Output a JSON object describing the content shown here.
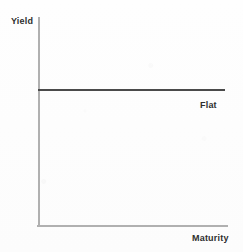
{
  "chart_data": {
    "type": "line",
    "title": "",
    "subtitle": "",
    "xlabel": "Maturity",
    "ylabel": "Yield",
    "grid": false,
    "legend": "none",
    "xlim": [
      0,
      100
    ],
    "ylim": [
      0,
      100
    ],
    "xticks": [],
    "yticks": [],
    "annotations": [
      {
        "text": "Flat",
        "x": 92,
        "y": 60,
        "position": "below-right-end-of-line"
      }
    ],
    "series": [
      {
        "name": "Flat",
        "color": "#4a4a4a",
        "x": [
          0,
          100
        ],
        "values": [
          65,
          65
        ]
      }
    ]
  },
  "figure": {
    "y_axis_label": "Yield",
    "x_axis_label": "Maturity",
    "curve_label": "Flat",
    "axis_color": "#b0b0b0",
    "curve_color": "#4a4a4a",
    "text_color": "#2e2e2e",
    "background_color": "#fdfdfd"
  }
}
